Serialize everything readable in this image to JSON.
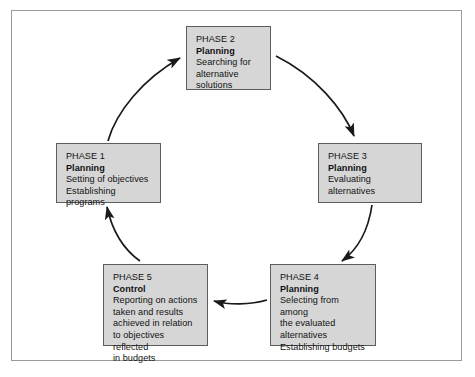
{
  "diagram": {
    "colors": {
      "box_fill": "#d6d6d6",
      "box_border": "#5d5d5d",
      "frame_border": "#9a9a9a",
      "arrow": "#1a1a1a",
      "background": "#ffffff"
    },
    "flow_direction": "clockwise"
  },
  "phases": [
    {
      "id": "phase-1",
      "title": "PHASE 1",
      "function": "Planning",
      "description": "Setting of objectives\nEstablishing programs"
    },
    {
      "id": "phase-2",
      "title": "PHASE 2",
      "function": "Planning",
      "description": "Searching for\nalternative\nsolutions"
    },
    {
      "id": "phase-3",
      "title": "PHASE 3",
      "function": "Planning",
      "description": "Evaluating\nalternatives"
    },
    {
      "id": "phase-4",
      "title": "PHASE 4",
      "function": "Planning",
      "description": "Selecting from among\nthe evaluated\nalternatives\nEstablishing budgets"
    },
    {
      "id": "phase-5",
      "title": "PHASE 5",
      "function": "Control",
      "description": "Reporting on actions\ntaken and results\nachieved in relation\nto objectives reflected\nin budgets"
    }
  ],
  "arrows": [
    {
      "id": "arrow-p1-p2",
      "from": "phase-1",
      "to": "phase-2"
    },
    {
      "id": "arrow-p2-p3",
      "from": "phase-2",
      "to": "phase-3"
    },
    {
      "id": "arrow-p3-p4",
      "from": "phase-3",
      "to": "phase-4"
    },
    {
      "id": "arrow-p4-p5",
      "from": "phase-4",
      "to": "phase-5"
    },
    {
      "id": "arrow-p5-p1",
      "from": "phase-5",
      "to": "phase-1"
    }
  ]
}
